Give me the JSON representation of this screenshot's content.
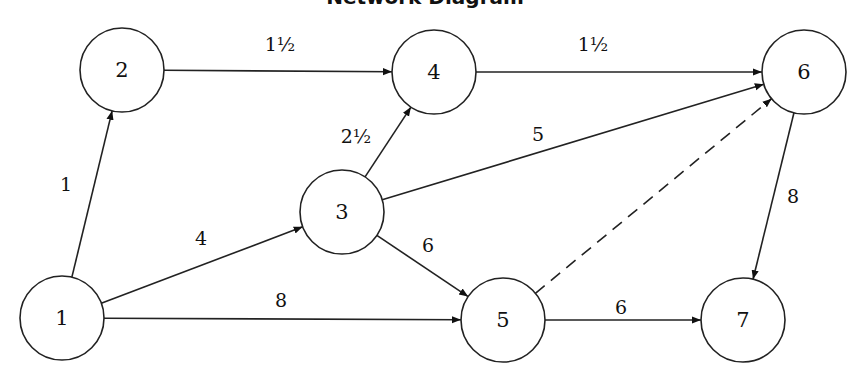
{
  "nodes": [
    {
      "id": "1",
      "label": "1",
      "x": 62,
      "y": 318
    },
    {
      "id": "2",
      "label": "2",
      "x": 122,
      "y": 70
    },
    {
      "id": "3",
      "label": "3",
      "x": 342,
      "y": 212
    },
    {
      "id": "4",
      "label": "4",
      "x": 434,
      "y": 72
    },
    {
      "id": "5",
      "label": "5",
      "x": 503,
      "y": 320
    },
    {
      "id": "6",
      "label": "6",
      "x": 804,
      "y": 72
    },
    {
      "id": "7",
      "label": "7",
      "x": 743,
      "y": 320
    }
  ],
  "edges": [
    {
      "from": "1",
      "to": "2",
      "label": "1",
      "lx": 66,
      "ly": 184,
      "dashed": false
    },
    {
      "from": "1",
      "to": "3",
      "label": "4",
      "lx": 201,
      "ly": 238,
      "dashed": false
    },
    {
      "from": "1",
      "to": "5",
      "label": "8",
      "lx": 281,
      "ly": 300,
      "dashed": false
    },
    {
      "from": "2",
      "to": "4",
      "label": "1½",
      "lx": 280,
      "ly": 44,
      "dashed": false
    },
    {
      "from": "3",
      "to": "4",
      "label": "2½",
      "lx": 356,
      "ly": 136,
      "dashed": false
    },
    {
      "from": "3",
      "to": "6",
      "label": "5",
      "lx": 538,
      "ly": 134,
      "dashed": false
    },
    {
      "from": "3",
      "to": "5",
      "label": "6",
      "lx": 428,
      "ly": 245,
      "dashed": false
    },
    {
      "from": "4",
      "to": "6",
      "label": "1½",
      "lx": 593,
      "ly": 44,
      "dashed": false
    },
    {
      "from": "5",
      "to": "6",
      "label": "",
      "lx": 0,
      "ly": 0,
      "dashed": true
    },
    {
      "from": "5",
      "to": "7",
      "label": "6",
      "lx": 621,
      "ly": 307,
      "dashed": false
    },
    {
      "from": "6",
      "to": "7",
      "label": "8",
      "lx": 793,
      "ly": 196,
      "dashed": false
    }
  ]
}
